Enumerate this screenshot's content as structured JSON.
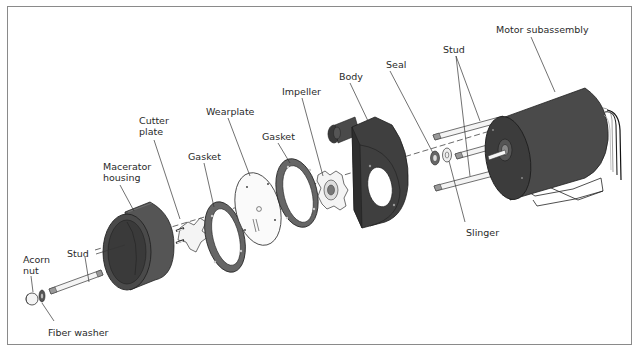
{
  "figure": {
    "labels": [
      {
        "id": "motor-subassembly",
        "text": "Motor subassembly",
        "x": 496,
        "y": 24
      },
      {
        "id": "stud-top",
        "text": "Stud",
        "x": 443,
        "y": 44
      },
      {
        "id": "seal",
        "text": "Seal",
        "x": 386,
        "y": 59
      },
      {
        "id": "body",
        "text": "Body",
        "x": 339,
        "y": 71
      },
      {
        "id": "impeller",
        "text": "Impeller",
        "x": 282,
        "y": 86
      },
      {
        "id": "wearplate",
        "text": "Wearplate",
        "x": 206,
        "y": 106
      },
      {
        "id": "gasket-right",
        "text": "Gasket",
        "x": 262,
        "y": 131
      },
      {
        "id": "cutter-plate",
        "text": "Cutter\nplate",
        "x": 139,
        "y": 115
      },
      {
        "id": "gasket-left",
        "text": "Gasket",
        "x": 188,
        "y": 151
      },
      {
        "id": "macerator-housing",
        "text": "Macerator\nhousing",
        "x": 103,
        "y": 161
      },
      {
        "id": "slinger",
        "text": "Slinger",
        "x": 466,
        "y": 227
      },
      {
        "id": "stud-left",
        "text": "Stud",
        "x": 67,
        "y": 248
      },
      {
        "id": "acorn-nut",
        "text": "Acorn\nnut",
        "x": 23,
        "y": 254
      },
      {
        "id": "fiber-washer",
        "text": "Fiber washer",
        "x": 48,
        "y": 327
      }
    ]
  },
  "colors": {
    "part_fill": "#4a4a4a",
    "part_dark": "#2e2e2e",
    "part_light": "#6a6a6a",
    "line": "#333333",
    "border": "#8a8a8a",
    "white_part": "#f4f4f4"
  }
}
